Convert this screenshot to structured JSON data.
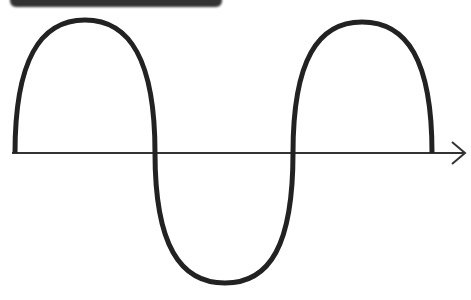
{
  "diagram": {
    "title_cropped": "",
    "curve": {
      "type": "sine",
      "color": "#222222",
      "stroke_width": 5,
      "start": [
        15,
        153
      ],
      "peak_1": [
        85,
        20
      ],
      "zero_cross_1": [
        155,
        153
      ],
      "trough": [
        225,
        283
      ],
      "zero_cross_2": [
        293,
        153
      ],
      "peak_2": [
        362,
        22
      ],
      "end": [
        432,
        153
      ]
    },
    "axis": {
      "color": "#333333",
      "y": 153,
      "x_start": 12,
      "x_end": 465,
      "arrow": "right"
    }
  }
}
